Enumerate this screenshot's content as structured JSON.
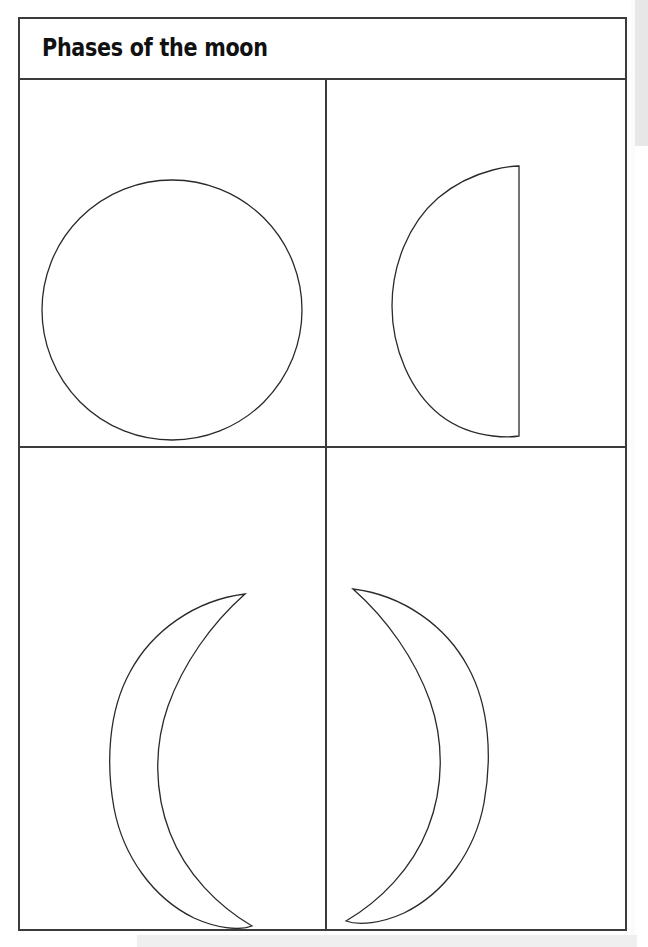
{
  "document": {
    "title": "Phases of the moon",
    "type": "worksheet",
    "page_background": "#ffffff",
    "frame_color": "#3b3b3b",
    "ink_color": "#2a2a2a"
  },
  "grid": {
    "columns": 2,
    "rows": 2,
    "cells": [
      {
        "position": "top-left",
        "icon_name": "full-moon-shape",
        "phase": "Full moon",
        "description": "Complete outlined circle",
        "geometry": {
          "cx": 170,
          "cy": 291,
          "r": 130
        }
      },
      {
        "position": "top-right",
        "icon_name": "half-moon-shape",
        "phase": "Half moon (last quarter)",
        "description": "Half disc with flat edge on the right, bulge to the left",
        "geometry": {
          "flat_x": 499,
          "top_y": 147,
          "bottom_y": 417,
          "bulge_x": 372
        }
      },
      {
        "position": "bottom-left",
        "icon_name": "crescent-moon-shape-left",
        "phase": "Crescent moon (waning)",
        "description": "Crescent opening toward the right, C shape",
        "geometry": {
          "top_tip": [
            243,
            575
          ],
          "bottom_tip": [
            250,
            845
          ],
          "outer_x": 110
        }
      },
      {
        "position": "bottom-right",
        "icon_name": "crescent-moon-shape-right",
        "phase": "Crescent moon (waxing)",
        "description": "Crescent opening toward the left, backwards C shape",
        "geometry": {
          "top_tip": [
            433,
            570
          ],
          "bottom_tip": [
            437,
            841
          ],
          "outer_x": 560
        }
      }
    ]
  },
  "chrome": {
    "scrollbar": {
      "name": "vertical-scrollbar",
      "thumb_color": "#e7e7e7",
      "track_color": "#ffffff",
      "thumb_top": 0,
      "thumb_height": 146
    }
  }
}
